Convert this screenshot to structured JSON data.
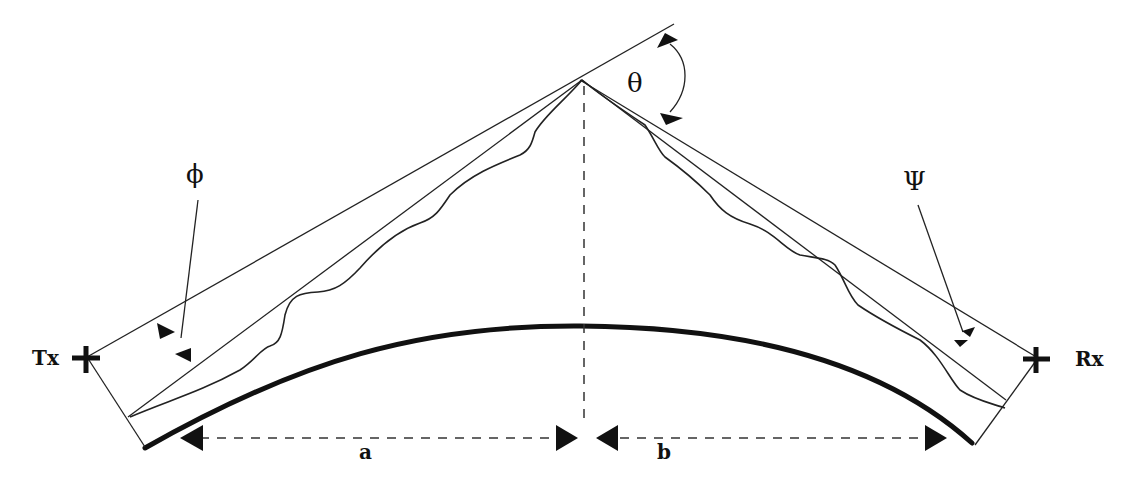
{
  "diagram": {
    "type": "knife-edge diffraction geometry over curved earth",
    "labels": {
      "transmitter": "Tx",
      "receiver": "Rx",
      "diffraction_angle": "θ",
      "tx_elevation_angle": "ϕ",
      "rx_elevation_angle": "Ψ",
      "distance_a": "a",
      "distance_b": "b"
    },
    "colors": {
      "ink": "#111111",
      "background": "#ffffff"
    }
  }
}
